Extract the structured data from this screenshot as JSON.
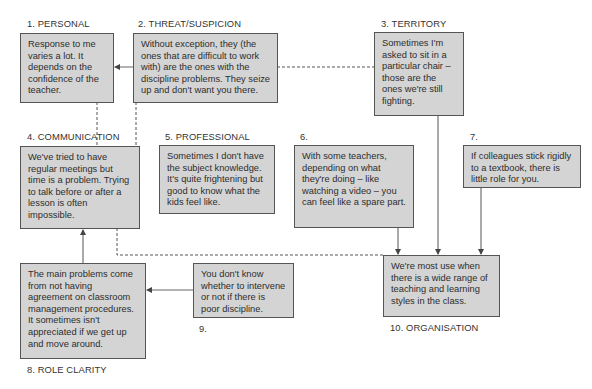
{
  "diagram": {
    "nodes": [
      {
        "id": "1",
        "label": "1. PERSONAL",
        "text": "Response to me varies a lot. It depends on the confidence of the teacher."
      },
      {
        "id": "2",
        "label": "2. THREAT/SUSPICION",
        "text": "Without exception, they (the ones that are difficult to work with) are the ones with the discipline problems. They seize up and don't want you there."
      },
      {
        "id": "3",
        "label": "3. TERRITORY",
        "text": "Sometimes I'm asked to sit in a particular chair – those are the ones we're still fighting."
      },
      {
        "id": "4",
        "label": "4. COMMUNICATION",
        "text": "We've tried to have regular meetings but time is a problem. Trying to talk before or after a lesson is often impossible."
      },
      {
        "id": "5",
        "label": "5. PROFESSIONAL",
        "text": "Sometimes I don't have the subject knowledge. It's quite frightening but good to know what the kids feel like."
      },
      {
        "id": "6",
        "label": "6.",
        "text": "With some teachers, depending on what they're doing – like watching a video – you can feel like a spare part."
      },
      {
        "id": "7",
        "label": "7.",
        "text": "If colleagues stick rigidly to a textbook, there is little role for you."
      },
      {
        "id": "8",
        "label": "8. ROLE CLARITY",
        "text": "The main problems come from not having agreement on classroom management procedures. It sometimes isn't appreciated if we get up and move around."
      },
      {
        "id": "9",
        "label": "9.",
        "text": "You don't know whether to intervene or not if there is poor discipline."
      },
      {
        "id": "10",
        "label": "10. ORGANISATION",
        "text": "We're most use when there is a wide range of teaching and learning styles in the class."
      }
    ],
    "edges": [
      {
        "from": "2",
        "to": "1",
        "style": "solid-arrow"
      },
      {
        "from": "2",
        "to": "3",
        "style": "dashed"
      },
      {
        "from": "1",
        "to": "4",
        "style": "dashed"
      },
      {
        "from": "2",
        "to": "4",
        "style": "dashed"
      },
      {
        "from": "3",
        "to": "10",
        "style": "solid-arrow"
      },
      {
        "from": "6",
        "to": "10",
        "style": "solid-arrow"
      },
      {
        "from": "7",
        "to": "10",
        "style": "solid-arrow"
      },
      {
        "from": "4",
        "to": "10",
        "style": "dashed"
      },
      {
        "from": "8",
        "to": "4",
        "style": "solid-arrow"
      },
      {
        "from": "9",
        "to": "8",
        "style": "solid-arrow"
      }
    ]
  },
  "colors": {
    "box_fill": "#d4d4d4",
    "box_border": "#555555",
    "line": "#555555",
    "text": "#2d2d2d"
  }
}
